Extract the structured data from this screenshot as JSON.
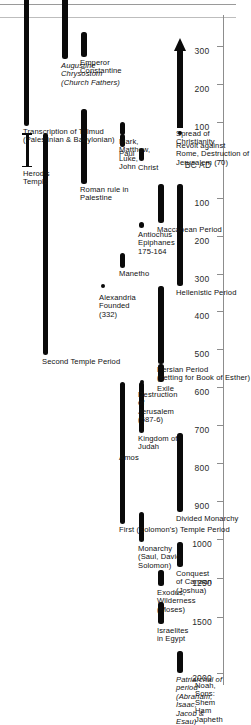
{
  "figure": {
    "orientation": "rotated-90",
    "background": "#ffffff",
    "bar_color": "#0a0a0a",
    "axis_color": "#8d8d8d"
  },
  "chart_data": {
    "type": "bar",
    "xlabel": "",
    "ylabel": "",
    "orientation": "horizontal-timeline",
    "axis": {
      "name": "years",
      "era_split_label": "BC AD",
      "note": "values left of the split are BC (descending), right of the split are AD (ascending)",
      "ticks": [
        {
          "label": "2000",
          "era": "BC",
          "value": -2000
        },
        {
          "label": "1500",
          "era": "BC",
          "value": -1500
        },
        {
          "label": "1250",
          "era": "BC",
          "value": -1250
        },
        {
          "label": "1000",
          "era": "BC",
          "value": -1000
        },
        {
          "label": "900",
          "era": "BC",
          "value": -900
        },
        {
          "label": "800",
          "era": "BC",
          "value": -800
        },
        {
          "label": "700",
          "era": "BC",
          "value": -700
        },
        {
          "label": "600",
          "era": "BC",
          "value": -600
        },
        {
          "label": "500",
          "era": "BC",
          "value": -500
        },
        {
          "label": "400",
          "era": "BC",
          "value": -400
        },
        {
          "label": "300",
          "era": "BC",
          "value": -300
        },
        {
          "label": "200",
          "era": "BC",
          "value": -200
        },
        {
          "label": "100",
          "era": "BC",
          "value": -100
        },
        {
          "label": "BC AD",
          "era": "split",
          "value": 0
        },
        {
          "label": "100",
          "era": "AD",
          "value": 100
        },
        {
          "label": "200",
          "era": "AD",
          "value": 200
        },
        {
          "label": "300",
          "era": "AD",
          "value": 300
        }
      ]
    },
    "legend": {
      "position": "none",
      "entries": []
    },
    "grid": false,
    "events": [
      {
        "label": "Noah,\nSons:\nShem\nHam\nJapheth",
        "kind": "text",
        "lane": 0,
        "start": -2000,
        "end": -2000
      },
      {
        "label": "Patriarchal of\nperiod\n(Abraham,\nIsaac,\nJacob &\nEsau)",
        "kind": "bar",
        "lane": 1,
        "start": -2000,
        "end": -1800,
        "italic": true
      },
      {
        "label": "Israelites\nin Egypt",
        "kind": "bar",
        "lane": 2,
        "start": -1560,
        "end": -1400
      },
      {
        "label": "Exodus,\nWilderness\n(Moses)",
        "kind": "bar",
        "lane": 2,
        "start": -1300,
        "end": -1200
      },
      {
        "label": "Conquest\nof Canaan\n(Joshua)",
        "kind": "bar",
        "lane": 1,
        "start": -1180,
        "end": -1020
      },
      {
        "label": "Monarchy\n(Saul, David,\nSolomon)",
        "kind": "bar",
        "lane": 3,
        "start": -1020,
        "end": -930
      },
      {
        "label": "Divided Monarchy",
        "kind": "bar",
        "lane": 1,
        "start": -930,
        "end": -720
      },
      {
        "label": "Amos",
        "kind": "bar",
        "lane": 4,
        "start": -770,
        "end": -745
      },
      {
        "label": "Kingdom of\nJudah",
        "kind": "bar",
        "lane": 3,
        "start": -720,
        "end": -587
      },
      {
        "label": "First (Solomon's) Temple Period",
        "kind": "bar",
        "lane": 4,
        "start": -960,
        "end": -587
      },
      {
        "label": "Destruction\nof\nJerusalem\n(587-6)",
        "kind": "dot",
        "lane": 3,
        "start": -587,
        "end": -587
      },
      {
        "label": "Exile",
        "kind": "bar",
        "lane": 2,
        "start": -587,
        "end": -538
      },
      {
        "label": "Persian Period\n(setting for Book of Esther)",
        "kind": "bar",
        "lane": 2,
        "start": -538,
        "end": -333
      },
      {
        "label": "Second Temple Period",
        "kind": "bar",
        "lane": 8,
        "start": -515,
        "end": 70
      },
      {
        "label": "Alexandria\nFounded\n(332)",
        "kind": "dot",
        "lane": 5,
        "start": -332,
        "end": -332
      },
      {
        "label": "Hellenistic Period",
        "kind": "bar",
        "lane": 1,
        "start": -333,
        "end": -63
      },
      {
        "label": "Manetho",
        "kind": "bar",
        "lane": 4,
        "start": -285,
        "end": -245
      },
      {
        "label": "Antiochus\nEpiphanes\n175-164",
        "kind": "bar",
        "lane": 3,
        "start": -175,
        "end": -164
      },
      {
        "label": "Maccabean Period",
        "kind": "bar",
        "lane": 2,
        "start": -167,
        "end": -63
      },
      {
        "label": "Roman rule in\nPalestine",
        "kind": "bar",
        "lane": 6,
        "start": -63,
        "end": 135
      },
      {
        "label": "Herod's\nTemple",
        "kind": "bracket",
        "lane": 9,
        "start": -20,
        "end": 70
      },
      {
        "label": "Christ",
        "kind": "bar",
        "lane": 3,
        "start": -4,
        "end": 30
      },
      {
        "label": "Paul",
        "kind": "bar",
        "lane": 4,
        "start": 33,
        "end": 67
      },
      {
        "label": "Mark,\nMatthew,\nLuke,\nJohn",
        "kind": "bar",
        "lane": 4,
        "start": 65,
        "end": 100
      },
      {
        "label": "Revolt against\nRome, Destruction of\nJerusalem (70)",
        "kind": "dot",
        "lane": 1,
        "start": 70,
        "end": 70
      },
      {
        "label": "Spread of\nChristianity",
        "kind": "arrow",
        "lane": 1,
        "start": 85,
        "end": 320
      },
      {
        "label": "Emperor\nConstantine",
        "kind": "bar",
        "lane": 6,
        "start": 272,
        "end": 337
      },
      {
        "label": "Augustine\nChrysostom\n(Church Fathers)",
        "kind": "bar",
        "lane": 7,
        "start": 265,
        "end": 430,
        "italic": true
      },
      {
        "label": "Transcription of Talmud\n(Palestinian & Babylonian)",
        "kind": "bar",
        "lane": 9,
        "start": 90,
        "end": 500
      }
    ]
  }
}
